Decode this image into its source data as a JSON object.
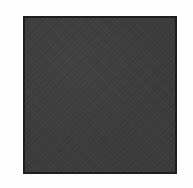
{
  "image": {
    "background_color": "#fdfdfd",
    "shape": {
      "type": "square",
      "fill_color": "#3b3b3b",
      "border_color": "#1e1e1e",
      "texture": "noise"
    }
  }
}
